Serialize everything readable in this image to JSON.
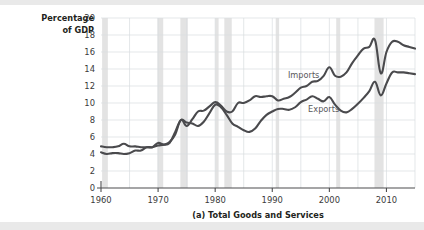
{
  "figure": {
    "caption": "(a) Total Goods and Services",
    "y_axis_title_line1": "Percentage",
    "y_axis_title_line2": "of GDP"
  },
  "colors": {
    "line": "#4a4a4d",
    "grid": "#d9dde0",
    "axis": "#4d4d4f",
    "recession_band": "#e3e3e3",
    "background": "#ffffff",
    "series_label": "#58585b"
  },
  "chart_data": {
    "type": "line",
    "title": "(a) Total Goods and Services",
    "xlabel": "",
    "ylabel": "Percentage of GDP",
    "xlim": [
      1960,
      2015
    ],
    "ylim": [
      0,
      20
    ],
    "grid": true,
    "legend_position": "inline-annotation",
    "x_tick_labels": [
      "1960",
      "1970",
      "1980",
      "1990",
      "2000",
      "2010"
    ],
    "x_ticks": [
      1960,
      1970,
      1980,
      1990,
      2000,
      2010
    ],
    "y_tick_labels": [
      "0",
      "2",
      "4",
      "6",
      "8",
      "10",
      "12",
      "14",
      "16",
      "18",
      "20"
    ],
    "y_ticks": [
      0,
      2,
      4,
      6,
      8,
      10,
      12,
      14,
      16,
      18,
      20
    ],
    "annotations": [
      {
        "text": "Imports",
        "x": 1995.5,
        "y": 13.0
      },
      {
        "text": "Exports",
        "x": 1999.0,
        "y": 9.0
      }
    ],
    "recession_bands": [
      {
        "start": 1960.2,
        "end": 1961.2
      },
      {
        "start": 1969.9,
        "end": 1970.9
      },
      {
        "start": 1973.9,
        "end": 1975.2
      },
      {
        "start": 1980.0,
        "end": 1980.6
      },
      {
        "start": 1981.6,
        "end": 1982.9
      },
      {
        "start": 1990.6,
        "end": 1991.2
      },
      {
        "start": 2001.2,
        "end": 2001.9
      },
      {
        "start": 2007.9,
        "end": 2009.5
      }
    ],
    "x": [
      1960,
      1961,
      1962,
      1963,
      1964,
      1965,
      1966,
      1967,
      1968,
      1969,
      1970,
      1971,
      1972,
      1973,
      1974,
      1975,
      1976,
      1977,
      1978,
      1979,
      1980,
      1981,
      1982,
      1983,
      1984,
      1985,
      1986,
      1987,
      1988,
      1989,
      1990,
      1991,
      1992,
      1993,
      1994,
      1995,
      1996,
      1997,
      1998,
      1999,
      2000,
      2001,
      2002,
      2003,
      2004,
      2005,
      2006,
      2007,
      2008,
      2009,
      2010,
      2011,
      2012,
      2013,
      2014,
      2015
    ],
    "series": [
      {
        "name": "Imports",
        "values": [
          4.2,
          4.0,
          4.1,
          4.1,
          4.0,
          4.1,
          4.4,
          4.4,
          4.8,
          4.8,
          5.0,
          5.1,
          5.4,
          6.3,
          8.0,
          7.3,
          8.1,
          9.0,
          9.1,
          9.6,
          10.1,
          9.7,
          9.0,
          9.0,
          10.0,
          10.0,
          10.3,
          10.8,
          10.7,
          10.8,
          10.8,
          10.3,
          10.5,
          10.7,
          11.2,
          11.8,
          12.0,
          12.5,
          12.6,
          13.2,
          14.2,
          13.2,
          13.1,
          13.6,
          14.7,
          15.6,
          16.4,
          16.6,
          17.4,
          13.5,
          16.0,
          17.2,
          17.2,
          16.8,
          16.6,
          16.4
        ]
      },
      {
        "name": "Exports",
        "values": [
          4.9,
          4.8,
          4.8,
          4.9,
          5.2,
          4.9,
          4.9,
          4.8,
          4.8,
          4.8,
          5.3,
          5.1,
          5.3,
          6.6,
          8.0,
          7.7,
          7.6,
          7.3,
          7.8,
          8.8,
          9.8,
          9.5,
          8.6,
          7.6,
          7.2,
          6.8,
          6.6,
          7.0,
          7.9,
          8.6,
          9.0,
          9.3,
          9.3,
          9.2,
          9.5,
          10.1,
          10.4,
          10.8,
          10.5,
          10.2,
          10.7,
          9.8,
          9.1,
          8.9,
          9.3,
          9.9,
          10.6,
          11.4,
          12.5,
          10.9,
          12.3,
          13.6,
          13.6,
          13.6,
          13.5,
          13.4
        ]
      }
    ]
  }
}
